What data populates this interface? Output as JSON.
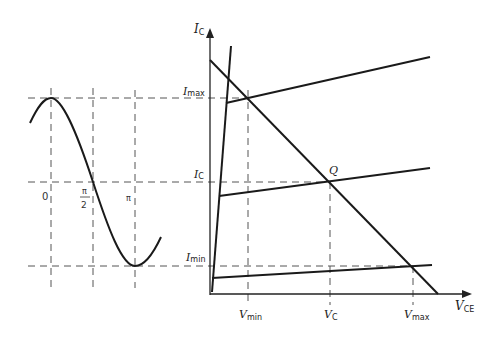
{
  "diagram": {
    "type": "transistor output characteristics with load line and sinusoidal base drive",
    "left_panel": {
      "curve": "sine (cosine) input waveform",
      "phase_labels": [
        "0",
        "π",
        "2",
        "π"
      ],
      "phase_label_meanings": [
        "0",
        "π/2",
        "π"
      ]
    },
    "right_panel": {
      "y_axis_label": "I",
      "y_axis_sub": "C",
      "x_axis_label": "V",
      "x_axis_sub": "CE",
      "y_levels": [
        {
          "main": "I",
          "sub": "max"
        },
        {
          "main": "I",
          "sub": "C"
        },
        {
          "main": "I",
          "sub": "min"
        }
      ],
      "x_levels": [
        {
          "main": "V",
          "sub": "min"
        },
        {
          "main": "V",
          "sub": "C"
        },
        {
          "main": "V",
          "sub": "max"
        }
      ],
      "operating_point": "Q"
    }
  }
}
